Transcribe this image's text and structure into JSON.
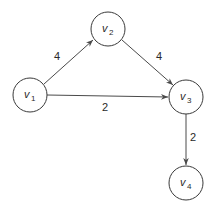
{
  "diagram": {
    "type": "weighted-directed-graph",
    "colors": {
      "node_stroke": "#3a3a3a",
      "edge": "#4a4a4a",
      "text": "#2a2a2a",
      "background": "#ffffff"
    },
    "nodes": [
      {
        "id": "v1",
        "label": "v",
        "sub": "1",
        "cx": 30,
        "cy": 95
      },
      {
        "id": "v2",
        "label": "v",
        "sub": "2",
        "cx": 108,
        "cy": 29
      },
      {
        "id": "v3",
        "label": "v",
        "sub": "3",
        "cx": 186,
        "cy": 97
      },
      {
        "id": "v4",
        "label": "v",
        "sub": "4",
        "cx": 186,
        "cy": 183
      }
    ],
    "edges": [
      {
        "from": "v1",
        "to": "v2",
        "weight": "4"
      },
      {
        "from": "v2",
        "to": "v3",
        "weight": "4"
      },
      {
        "from": "v1",
        "to": "v3",
        "weight": "2"
      },
      {
        "from": "v3",
        "to": "v4",
        "weight": "2"
      }
    ]
  }
}
